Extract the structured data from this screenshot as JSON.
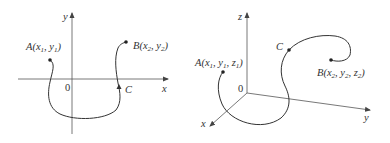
{
  "figures": [
    {
      "id": "plane-curve",
      "axes": {
        "x_label": "x",
        "y_label": "y",
        "origin_label": "0"
      },
      "points": {
        "A": {
          "name": "A",
          "coords": [
            "x",
            "1",
            "y",
            "1"
          ]
        },
        "B": {
          "name": "B",
          "coords": [
            "x",
            "2",
            "y",
            "2"
          ]
        },
        "C": {
          "name": "C"
        }
      }
    },
    {
      "id": "space-curve",
      "axes": {
        "x_label": "x",
        "y_label": "y",
        "z_label": "z",
        "origin_label": "0"
      },
      "points": {
        "A": {
          "name": "A",
          "coords": [
            "x",
            "1",
            "y",
            "1",
            "z",
            "1"
          ]
        },
        "B": {
          "name": "B",
          "coords": [
            "x",
            "2",
            "y",
            "2",
            "z",
            "2"
          ]
        },
        "C": {
          "name": "C"
        }
      }
    }
  ],
  "colors": {
    "stroke": "#444444",
    "text": "#333333",
    "background": "#ffffff"
  }
}
